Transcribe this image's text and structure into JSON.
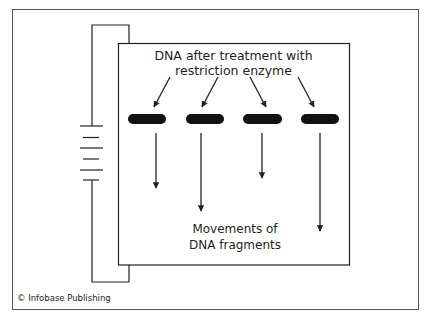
{
  "diagram": {
    "top_label": {
      "line1": "DNA after treatment with",
      "line2": "restriction enzyme"
    },
    "bottom_label": {
      "line1": "Movements of",
      "line2": "DNA fragments"
    },
    "credit": "© Infobase Publishing",
    "components": {
      "power_source": "battery-icon",
      "gel": "gel-box",
      "wells": 4,
      "fragment_arrows": 4
    },
    "colors": {
      "line": "#231f20",
      "background": "#ffffff",
      "band": "#111111"
    }
  }
}
